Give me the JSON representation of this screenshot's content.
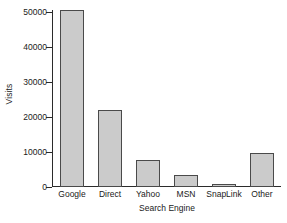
{
  "chart_data": {
    "type": "bar",
    "title": "",
    "categories": [
      "Google",
      "Direct",
      "Yahoo",
      "MSN",
      "SnapLink",
      "Other"
    ],
    "values": [
      50700,
      22000,
      7800,
      3500,
      1000,
      9800
    ],
    "xlabel": "Search Engine",
    "ylabel": "Visits",
    "ylim": [
      0,
      50000
    ],
    "yticks": [
      0,
      10000,
      20000,
      30000,
      40000,
      50000
    ],
    "ytick_labels": [
      "0",
      "10000",
      "20000",
      "30000",
      "40000",
      "50000"
    ],
    "grid": false,
    "legend": null,
    "bar_fill_color": "#cbcbcb",
    "bar_edge_color": "#4a4a4a",
    "axis_color": "#2b2b2b",
    "background_color": "#ffffff"
  }
}
